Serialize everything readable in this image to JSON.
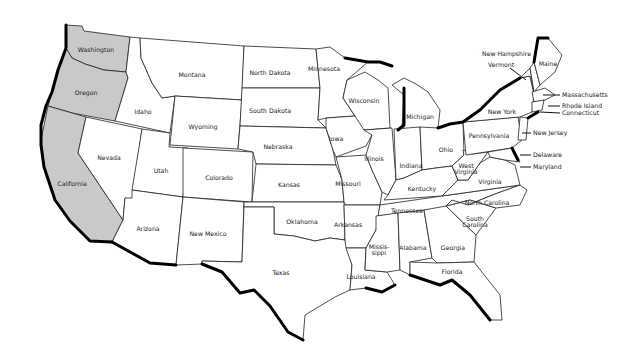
{
  "map": {
    "title": "United States map",
    "highlight_color": "#c9c9c9",
    "highlighted_states": [
      "Washington",
      "Oregon",
      "California"
    ],
    "states": [
      {
        "name": "Washington",
        "x": 96,
        "y": 50
      },
      {
        "name": "Oregon",
        "x": 86,
        "y": 93
      },
      {
        "name": "California",
        "x": 72,
        "y": 184
      },
      {
        "name": "Idaho",
        "x": 143,
        "y": 112
      },
      {
        "name": "Montana",
        "x": 192,
        "y": 75
      },
      {
        "name": "Nevada",
        "x": 109,
        "y": 158
      },
      {
        "name": "Utah",
        "x": 161,
        "y": 171
      },
      {
        "name": "Wyoming",
        "x": 203,
        "y": 127
      },
      {
        "name": "Arizona",
        "x": 148,
        "y": 229
      },
      {
        "name": "Colorado",
        "x": 219,
        "y": 178
      },
      {
        "name": "New Mexico",
        "x": 208,
        "y": 234
      },
      {
        "name": "North Dakota",
        "x": 270,
        "y": 73
      },
      {
        "name": "South Dakota",
        "x": 270,
        "y": 111
      },
      {
        "name": "Nebraska",
        "x": 278,
        "y": 147
      },
      {
        "name": "Kansas",
        "x": 289,
        "y": 185
      },
      {
        "name": "Oklahoma",
        "x": 302,
        "y": 222
      },
      {
        "name": "Texas",
        "x": 281,
        "y": 273
      },
      {
        "name": "Minnesota",
        "x": 324,
        "y": 69
      },
      {
        "name": "Iowa",
        "x": 336,
        "y": 139
      },
      {
        "name": "Missouri",
        "x": 348,
        "y": 184
      },
      {
        "name": "Arkansas",
        "x": 348,
        "y": 225
      },
      {
        "name": "Louisiana",
        "x": 361,
        "y": 277
      },
      {
        "name": "Wisconsin",
        "x": 364,
        "y": 101
      },
      {
        "name": "Illinois",
        "x": 374,
        "y": 159
      },
      {
        "name": "Michigan",
        "x": 420,
        "y": 117
      },
      {
        "name": "Indiana",
        "x": 411,
        "y": 166
      },
      {
        "name": "Ohio",
        "x": 446,
        "y": 150
      },
      {
        "name": "Kentucky",
        "x": 422,
        "y": 189
      },
      {
        "name": "Tennessee",
        "x": 407,
        "y": 211
      },
      {
        "name": "Mississippi",
        "label": "Missis-\nsippi",
        "x": 379,
        "y": 250
      },
      {
        "name": "Alabama",
        "x": 413,
        "y": 248
      },
      {
        "name": "Georgia",
        "x": 453,
        "y": 248
      },
      {
        "name": "Florida",
        "x": 452,
        "y": 272
      },
      {
        "name": "South Carolina",
        "label": "South\nCarolina",
        "x": 475,
        "y": 222
      },
      {
        "name": "North Carolina",
        "x": 487,
        "y": 203
      },
      {
        "name": "Virginia",
        "x": 490,
        "y": 182
      },
      {
        "name": "West Virginia",
        "label": "West\nVirginia",
        "x": 466,
        "y": 169
      },
      {
        "name": "Pennsylvania",
        "x": 489,
        "y": 136
      },
      {
        "name": "New York",
        "x": 502,
        "y": 112
      },
      {
        "name": "Maine",
        "x": 548,
        "y": 64
      }
    ],
    "callouts": [
      {
        "name": "New Hampshire",
        "x": 482,
        "y": 54
      },
      {
        "name": "Vermont",
        "x": 488,
        "y": 65
      },
      {
        "name": "Massachusetts",
        "x": 562,
        "y": 95
      },
      {
        "name": "Rhode Island",
        "x": 562,
        "y": 106
      },
      {
        "name": "Connecticut",
        "x": 562,
        "y": 113
      },
      {
        "name": "New Jersey",
        "x": 533,
        "y": 133
      },
      {
        "name": "Delaware",
        "x": 533,
        "y": 155
      },
      {
        "name": "Maryland",
        "x": 533,
        "y": 167
      }
    ]
  }
}
